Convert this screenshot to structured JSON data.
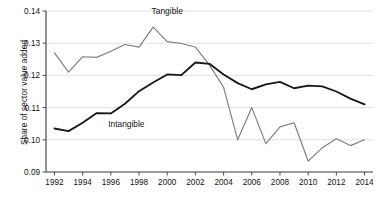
{
  "chart_data": {
    "type": "line",
    "title": "",
    "xlabel": "",
    "ylabel": "Share of sector value added",
    "x": [
      1992,
      1993,
      1994,
      1995,
      1996,
      1997,
      1998,
      1999,
      2000,
      2001,
      2002,
      2003,
      2004,
      2005,
      2006,
      2007,
      2008,
      2009,
      2010,
      2011,
      2012,
      2013,
      2014
    ],
    "xlim": [
      1991.4,
      2014.6
    ],
    "ylim": [
      0.09,
      0.14
    ],
    "yticks": [
      0.09,
      0.1,
      0.11,
      0.12,
      0.13,
      0.14
    ],
    "ytick_labels": [
      "0.09",
      "0.10",
      "0.11",
      "0.12",
      "0.13",
      "0.14"
    ],
    "xticks": [
      1992,
      1994,
      1996,
      1998,
      2000,
      2002,
      2004,
      2006,
      2008,
      2010,
      2012,
      2014
    ],
    "xtick_labels": [
      "1992",
      "1994",
      "1996",
      "1998",
      "2000",
      "2002",
      "2004",
      "2006",
      "2008",
      "2010",
      "2012",
      "2014"
    ],
    "grid": "horizontal",
    "legend": "inline-annotations",
    "series": [
      {
        "name": "Tangible",
        "color": "#7d7d7d",
        "label_x": 2000.0,
        "label_y": 0.1392,
        "values": [
          0.127,
          0.121,
          0.1258,
          0.1256,
          0.1275,
          0.1296,
          0.1288,
          0.135,
          0.1305,
          0.1299,
          0.1288,
          0.1232,
          0.1163,
          0.1,
          0.11,
          0.0988,
          0.104,
          0.1053,
          0.0934,
          0.0975,
          0.1003,
          0.0982,
          0.1
        ]
      },
      {
        "name": "Intangible",
        "color": "#171717",
        "label_x": 1997.1,
        "label_y": 0.1041,
        "values": [
          0.1035,
          0.1027,
          0.1053,
          0.1083,
          0.1082,
          0.1112,
          0.1151,
          0.1178,
          0.1203,
          0.1201,
          0.124,
          0.1236,
          0.1203,
          0.1176,
          0.1157,
          0.1172,
          0.118,
          0.116,
          0.1168,
          0.1166,
          0.115,
          0.1128,
          0.111
        ]
      }
    ]
  }
}
